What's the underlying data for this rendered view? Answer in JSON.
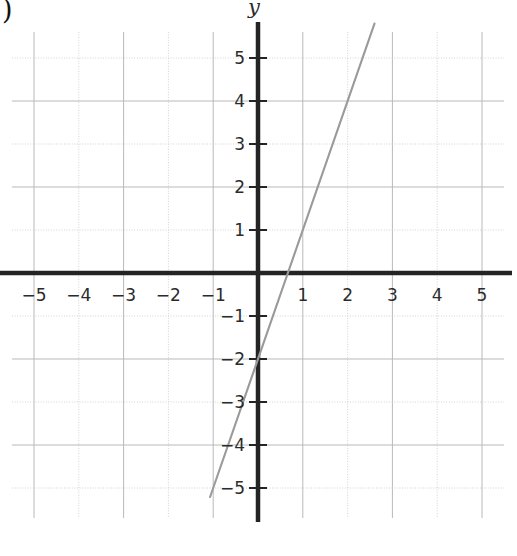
{
  "figure": {
    "leader_fragment": ")",
    "y_axis_name": "y",
    "background": "#ffffff",
    "grid_color": "#b9b9b9",
    "grid_minor_color": "#d2d2d2",
    "axis_color": "#242424",
    "line_color": "#9a9a9a"
  },
  "chart_data": {
    "type": "line",
    "title": "",
    "xlabel": "",
    "ylabel": "y",
    "xlim": [
      -5.5,
      5.5
    ],
    "ylim": [
      -5.7,
      5.5
    ],
    "grid": true,
    "legend": null,
    "x_ticks": [
      -5,
      -4,
      -3,
      -2,
      -1,
      1,
      2,
      3,
      4,
      5
    ],
    "x_tick_labels": [
      "−5",
      "−4",
      "−3",
      "−2",
      "−1",
      "1",
      "2",
      "3",
      "4",
      "5"
    ],
    "y_ticks": [
      5,
      4,
      3,
      2,
      1,
      -1,
      -2,
      -3,
      -4,
      -5
    ],
    "y_tick_labels": [
      "5",
      "4",
      "3",
      "2",
      "1",
      "−1",
      "−2",
      "−3",
      "−4",
      "−5"
    ],
    "series": [
      {
        "name": "y = 3x - 2",
        "equation": "y = 3x - 2",
        "slope": 3,
        "y_intercept": -2,
        "x_intercept": 0.667,
        "points": [
          {
            "x": -1.07,
            "y": -5.2
          },
          {
            "x": 0.667,
            "y": 0
          },
          {
            "x": 1,
            "y": 1
          },
          {
            "x": 2,
            "y": 4
          },
          {
            "x": 2.6,
            "y": 5.8
          }
        ],
        "x_start": -1.07,
        "x_end": 2.6
      }
    ]
  }
}
